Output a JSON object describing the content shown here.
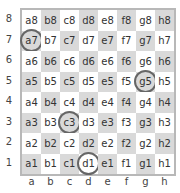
{
  "board": {
    "files": [
      "a",
      "b",
      "c",
      "d",
      "e",
      "f",
      "g",
      "h"
    ],
    "ranks": [
      "8",
      "7",
      "6",
      "5",
      "4",
      "3",
      "2",
      "1"
    ],
    "highlighted_squares": [
      "a7",
      "g5",
      "c3",
      "d1"
    ],
    "colors": {
      "light": "#ffffff",
      "dark": "#d9d9d9",
      "border": "#b8b8b8",
      "marker": "#666666"
    },
    "squares": [
      [
        "a8",
        "b8",
        "c8",
        "d8",
        "e8",
        "f8",
        "g8",
        "h8"
      ],
      [
        "a7",
        "b7",
        "c7",
        "d7",
        "e7",
        "f7",
        "g7",
        "h7"
      ],
      [
        "a6",
        "b6",
        "c6",
        "d6",
        "e6",
        "f6",
        "g6",
        "h6"
      ],
      [
        "a5",
        "b5",
        "c5",
        "d5",
        "e5",
        "f5",
        "g5",
        "h5"
      ],
      [
        "a4",
        "b4",
        "c4",
        "d4",
        "e4",
        "f4",
        "g4",
        "h4"
      ],
      [
        "a3",
        "b3",
        "c3",
        "d3",
        "e3",
        "f3",
        "g3",
        "h3"
      ],
      [
        "a2",
        "b2",
        "c2",
        "d2",
        "e2",
        "f2",
        "g2",
        "h2"
      ],
      [
        "a1",
        "b1",
        "c1",
        "d1",
        "e1",
        "f1",
        "g1",
        "h1"
      ]
    ]
  }
}
